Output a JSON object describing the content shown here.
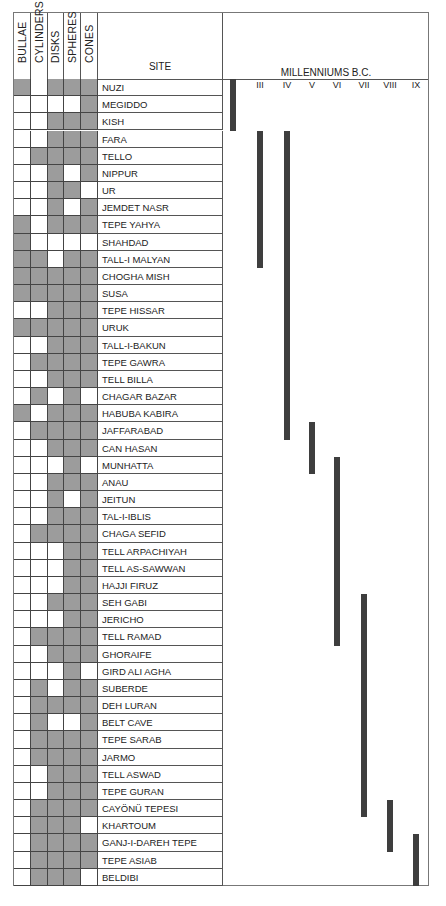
{
  "header": {
    "token_types": [
      "BULLAE",
      "CYLINDERS",
      "DISKS",
      "SPHERES",
      "CONES"
    ],
    "site_label": "SITE",
    "timeline_title": "MILLENNIUMS B.C.",
    "millenniums": [
      "II",
      "III",
      "IV",
      "V",
      "VI",
      "VII",
      "VIII",
      "IX"
    ]
  },
  "colors": {
    "filled_cell": "#9c9c9c",
    "bar": "#3e3e3e",
    "grid": "#444444"
  },
  "chart_data": {
    "type": "table",
    "columns": [
      "BULLAE",
      "CYLINDERS",
      "DISKS",
      "SPHERES",
      "CONES"
    ],
    "timeline_axis": [
      "II",
      "III",
      "IV",
      "V",
      "VI",
      "VII",
      "VIII",
      "IX"
    ],
    "timeline_label": "MILLENNIUMS B.C.",
    "rows": [
      {
        "site": "NUZI",
        "tokens": [
          1,
          0,
          1,
          1,
          1
        ]
      },
      {
        "site": "MEGIDDO",
        "tokens": [
          0,
          0,
          0,
          0,
          1
        ]
      },
      {
        "site": "KISH",
        "tokens": [
          0,
          0,
          1,
          1,
          1
        ]
      },
      {
        "site": "FARA",
        "tokens": [
          0,
          0,
          1,
          1,
          1
        ]
      },
      {
        "site": "TELLO",
        "tokens": [
          0,
          1,
          1,
          1,
          1
        ]
      },
      {
        "site": "NIPPUR",
        "tokens": [
          0,
          0,
          1,
          0,
          1
        ]
      },
      {
        "site": "UR",
        "tokens": [
          0,
          0,
          1,
          1,
          0
        ]
      },
      {
        "site": "JEMDET NASR",
        "tokens": [
          0,
          0,
          1,
          0,
          1
        ]
      },
      {
        "site": "TEPE YAHYA",
        "tokens": [
          1,
          0,
          1,
          1,
          1
        ]
      },
      {
        "site": "SHAHDAD",
        "tokens": [
          1,
          0,
          0,
          0,
          0
        ]
      },
      {
        "site": "TALL-I MALYAN",
        "tokens": [
          1,
          1,
          0,
          1,
          1
        ]
      },
      {
        "site": "CHOGHA MISH",
        "tokens": [
          1,
          1,
          1,
          1,
          1
        ]
      },
      {
        "site": "SUSA",
        "tokens": [
          1,
          1,
          1,
          1,
          1
        ]
      },
      {
        "site": "TEPE HISSAR",
        "tokens": [
          0,
          0,
          1,
          1,
          1
        ]
      },
      {
        "site": "URUK",
        "tokens": [
          1,
          1,
          1,
          1,
          1
        ]
      },
      {
        "site": "TALL-I-BAKUN",
        "tokens": [
          0,
          0,
          1,
          1,
          1
        ]
      },
      {
        "site": "TEPE GAWRA",
        "tokens": [
          0,
          1,
          1,
          1,
          1
        ]
      },
      {
        "site": "TELL BILLA",
        "tokens": [
          0,
          0,
          1,
          1,
          1
        ]
      },
      {
        "site": "CHAGAR BAZAR",
        "tokens": [
          0,
          1,
          0,
          1,
          0
        ]
      },
      {
        "site": "HABUBA KABIRA",
        "tokens": [
          1,
          0,
          1,
          1,
          1
        ]
      },
      {
        "site": "JAFFARABAD",
        "tokens": [
          0,
          1,
          1,
          1,
          1
        ]
      },
      {
        "site": "CAN HASAN",
        "tokens": [
          0,
          0,
          1,
          1,
          1
        ]
      },
      {
        "site": "MUNHATTA",
        "tokens": [
          0,
          0,
          0,
          1,
          0
        ]
      },
      {
        "site": "ANAU",
        "tokens": [
          0,
          0,
          1,
          1,
          1
        ]
      },
      {
        "site": "JEITUN",
        "tokens": [
          0,
          0,
          1,
          0,
          1
        ]
      },
      {
        "site": "TAL-I-IBLIS",
        "tokens": [
          0,
          0,
          1,
          1,
          1
        ]
      },
      {
        "site": "CHAGA SEFID",
        "tokens": [
          0,
          1,
          1,
          1,
          1
        ]
      },
      {
        "site": "TELL ARPACHIYAH",
        "tokens": [
          0,
          0,
          0,
          1,
          1
        ]
      },
      {
        "site": "TELL AS-SAWWAN",
        "tokens": [
          0,
          0,
          0,
          1,
          1
        ]
      },
      {
        "site": "HAJJI FIRUZ",
        "tokens": [
          0,
          0,
          0,
          1,
          1
        ]
      },
      {
        "site": "SEH GABI",
        "tokens": [
          0,
          0,
          1,
          1,
          1
        ]
      },
      {
        "site": "JERICHO",
        "tokens": [
          0,
          0,
          0,
          1,
          1
        ]
      },
      {
        "site": "TELL RAMAD",
        "tokens": [
          0,
          1,
          1,
          1,
          1
        ]
      },
      {
        "site": "GHORAIFE",
        "tokens": [
          0,
          0,
          1,
          1,
          1
        ]
      },
      {
        "site": "GIRD ALI AGHA",
        "tokens": [
          0,
          0,
          0,
          1,
          0
        ]
      },
      {
        "site": "SUBERDE",
        "tokens": [
          0,
          1,
          0,
          1,
          1
        ]
      },
      {
        "site": "DEH LURAN",
        "tokens": [
          0,
          1,
          1,
          1,
          1
        ]
      },
      {
        "site": "BELT CAVE",
        "tokens": [
          0,
          1,
          0,
          0,
          1
        ]
      },
      {
        "site": "TEPE SARAB",
        "tokens": [
          0,
          1,
          1,
          1,
          1
        ]
      },
      {
        "site": "JARMO",
        "tokens": [
          0,
          1,
          1,
          1,
          1
        ]
      },
      {
        "site": "TELL ASWAD",
        "tokens": [
          0,
          0,
          1,
          1,
          1
        ]
      },
      {
        "site": "TEPE GURAN",
        "tokens": [
          0,
          0,
          1,
          1,
          1
        ]
      },
      {
        "site": "CAYÖNÜ TEPESI",
        "tokens": [
          0,
          1,
          1,
          1,
          1
        ]
      },
      {
        "site": "KHARTOUM",
        "tokens": [
          0,
          1,
          1,
          1,
          0
        ]
      },
      {
        "site": "GANJ-I-DAREH TEPE",
        "tokens": [
          0,
          1,
          1,
          1,
          1
        ]
      },
      {
        "site": "TEPE ASIAB",
        "tokens": [
          0,
          1,
          1,
          1,
          1
        ]
      },
      {
        "site": "BELDIBI",
        "tokens": [
          0,
          1,
          1,
          1,
          0
        ]
      }
    ],
    "bars": [
      {
        "millennium": "II",
        "from_row": 0,
        "to_row": 2,
        "sites": "NUZI – KISH"
      },
      {
        "millennium": "III",
        "from_row": 3,
        "to_row": 10,
        "sites": "FARA – TALL-I MALYAN"
      },
      {
        "millennium": "IV",
        "from_row": 3,
        "to_row": 20,
        "sites": "FARA – JAFFARABAD"
      },
      {
        "millennium": "V",
        "from_row": 20,
        "to_row": 22,
        "sites": "JAFFARABAD – MUNHATTA"
      },
      {
        "millennium": "VI",
        "from_row": 22,
        "to_row": 32,
        "sites": "MUNHATTA – TELL RAMAD"
      },
      {
        "millennium": "VII",
        "from_row": 30,
        "to_row": 42,
        "sites": "SEH GABI – CAYÖNÜ TEPESI"
      },
      {
        "millennium": "VIII",
        "from_row": 42,
        "to_row": 44,
        "sites": "CAYÖNÜ TEPESI – GANJ-I-DAREH TEPE"
      },
      {
        "millennium": "IX",
        "from_row": 44,
        "to_row": 46,
        "sites": "GANJ-I-DAREH TEPE – BELDIBI"
      }
    ]
  }
}
